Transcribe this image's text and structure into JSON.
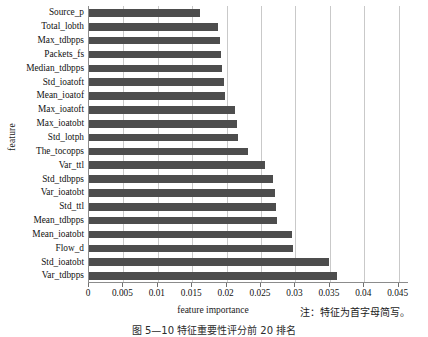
{
  "chart_data": {
    "type": "bar",
    "orientation": "horizontal",
    "title": "",
    "xlabel": "feature importance",
    "ylabel": "feature",
    "xlim": [
      0,
      0.0465
    ],
    "xticks": [
      0,
      0.005,
      0.01,
      0.015,
      0.02,
      0.025,
      0.03,
      0.035,
      0.04,
      0.045
    ],
    "xtick_labels": [
      "0",
      "0.005",
      "0.01",
      "0.015",
      "0.02",
      "0.025",
      "0.03",
      "0.035",
      "0.04",
      "0.045"
    ],
    "grid": "vertical",
    "legend": null,
    "bar_color": "#4d4d4d",
    "categories": [
      "Source_p",
      "Total_lobth",
      "Max_tdbpps",
      "Packets_fs",
      "Median_tdbpps",
      "Std_ioatoft",
      "Mean_ioatof",
      "Max_ioatoft",
      "Max_ioatobt",
      "Std_lotph",
      "The_tocopps",
      "Var_ttl",
      "Std_tdbpps",
      "Var_ioatobt",
      "Std_ttl",
      "Mean_tdbpps",
      "Mean_ioatobt",
      "Flow_d",
      "Std_ioatobt",
      "Var_tdbpps"
    ],
    "values": [
      0.0162,
      0.0188,
      0.0191,
      0.0192,
      0.0193,
      0.0196,
      0.0198,
      0.0212,
      0.0215,
      0.0217,
      0.0231,
      0.0256,
      0.0268,
      0.0271,
      0.0272,
      0.0273,
      0.0295,
      0.0297,
      0.0349,
      0.036
    ]
  },
  "note": "注：特征为首字母简写。",
  "caption": "图 5—10  特征重要性评分前 20 排名"
}
